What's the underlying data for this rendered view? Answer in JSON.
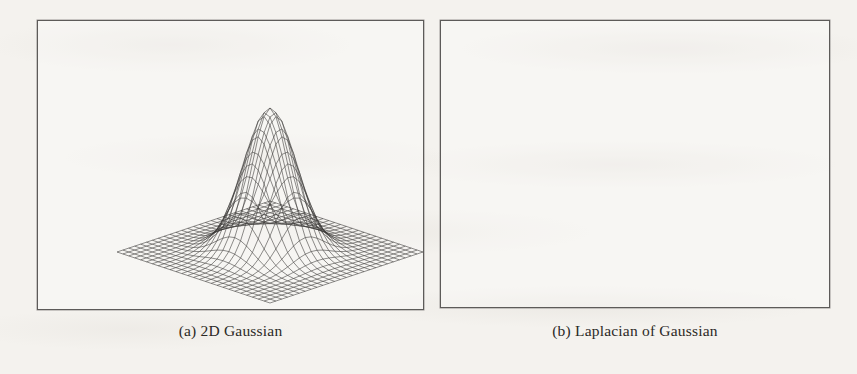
{
  "figure": {
    "background_color": "#f4f2ee",
    "ink_color": "#3a3836",
    "frame_color": "#5d5b59",
    "panels": [
      {
        "id": "gaussian",
        "caption": "(a) 2D Gaussian",
        "caption_label": "(a)",
        "caption_title": "2D Gaussian"
      },
      {
        "id": "log",
        "caption": "(b) Laplacian of Gaussian",
        "caption_label": "(b)",
        "caption_title": "Laplacian of Gaussian"
      }
    ]
  },
  "chart_data": [
    {
      "type": "surface",
      "id": "gaussian",
      "title": "(a) 2D Gaussian",
      "render": "wireframe-mesh",
      "projection": "isometric-3d",
      "xlabel": "",
      "ylabel": "",
      "zlabel": "",
      "axes_visible": false,
      "grid": false,
      "legend": null,
      "tick_labels": [],
      "annotations": [],
      "function": "G(x,y) = exp(-(x^2 + y^2) / (2*sigma^2))",
      "sigma": 1.0,
      "amplitude": 1.0,
      "mesh_n": 26,
      "domain": {
        "x": [
          -4,
          4
        ],
        "y": [
          -4,
          4
        ]
      },
      "zlim": [
        0,
        1
      ],
      "peak": {
        "x": 0,
        "y": 0,
        "z": 1.0
      },
      "description": "Single smooth bell-shaped positive peak centred on a flat square base plane; mesh lines dense and dark across the flat skirt, open and light over the peak.",
      "projection_geometry": {
        "center_x": 233,
        "base_y": 232,
        "half_width": 153,
        "half_depth": 51,
        "peak_height": 144
      }
    },
    {
      "type": "surface",
      "id": "log",
      "title": "(b) Laplacian of Gaussian",
      "render": "wireframe-mesh",
      "projection": "isometric-3d",
      "xlabel": "",
      "ylabel": "",
      "zlabel": "",
      "axes_visible": false,
      "grid": false,
      "legend": null,
      "tick_labels": [],
      "annotations": [],
      "function": "LoG(x,y) = -(1/(pi*sigma^4)) * (1 - (x^2+y^2)/(2*sigma^2)) * exp(-(x^2+y^2)/(2*sigma^2))",
      "sigma": 1.0,
      "mesh_n": 26,
      "domain": {
        "x": [
          -4,
          4
        ],
        "y": [
          -4,
          4
        ]
      },
      "zlim": [
        -1,
        0.22
      ],
      "peak": {
        "x": 0,
        "y": 0,
        "z": -1.0
      },
      "rim": {
        "radius": 1.41,
        "z": 0.22
      },
      "description": "Inverted Mexican-hat: a raised annular positive rim surrounding a deep narrow negative spike at the centre, plunging far below the flat base plane; spike drawn with sparse converging wireframe lines.",
      "projection_geometry": {
        "center_x": 635,
        "base_y": 103,
        "half_width": 150,
        "half_depth": 50,
        "rim_height": 34,
        "spike_depth": 162
      }
    }
  ]
}
